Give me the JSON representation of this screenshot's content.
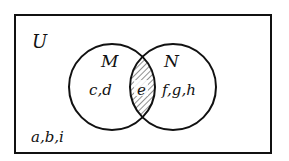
{
  "diagram": {
    "type": "venn",
    "universe": {
      "label": "U",
      "outside_elements": "a,b,i"
    },
    "sets": [
      {
        "label": "M",
        "only_elements": "c,d"
      },
      {
        "label": "N",
        "only_elements": "f,g,h"
      }
    ],
    "intersection": {
      "elements": "e",
      "shaded": true
    },
    "colors": {
      "stroke": "#111111",
      "background": "#ffffff"
    }
  }
}
